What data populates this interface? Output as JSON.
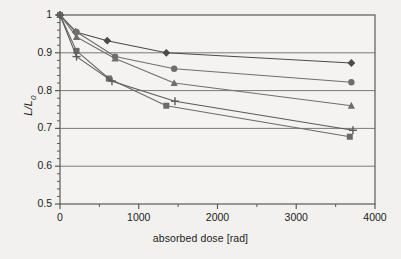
{
  "chart_data": {
    "type": "line",
    "title": "",
    "xlabel": "absorbed dose [rad]",
    "ylabel": "L/L0",
    "ylabel_main": "L/L",
    "ylabel_sub": "0",
    "xlim": [
      0,
      4000
    ],
    "ylim": [
      0.5,
      1.0
    ],
    "xticks": [
      0,
      1000,
      2000,
      3000,
      4000
    ],
    "xtick_labels": [
      "0",
      "1000",
      "2000",
      "3000",
      "4000"
    ],
    "xminor_interval": 500,
    "yticks": [
      0.5,
      0.6,
      0.7,
      0.8,
      0.9,
      1.0
    ],
    "ytick_labels": [
      "0.5",
      "0.6",
      "0.7",
      "0.8",
      "0.9",
      "1"
    ],
    "yminor_interval": 0.02,
    "grid": "horizontal-major",
    "legend": "none",
    "series": [
      {
        "name": "series-diamond",
        "marker": "diamond",
        "color": "#4a4a4a",
        "points": [
          {
            "x": 0,
            "y": 1.0
          },
          {
            "x": 200,
            "y": 0.955
          },
          {
            "x": 600,
            "y": 0.932
          },
          {
            "x": 1350,
            "y": 0.9
          },
          {
            "x": 3700,
            "y": 0.873
          }
        ]
      },
      {
        "name": "series-circle",
        "marker": "circle",
        "color": "#6e6e6e",
        "points": [
          {
            "x": 0,
            "y": 1.0
          },
          {
            "x": 210,
            "y": 0.955
          },
          {
            "x": 700,
            "y": 0.89
          },
          {
            "x": 1450,
            "y": 0.858
          },
          {
            "x": 3700,
            "y": 0.822
          }
        ]
      },
      {
        "name": "series-triangle",
        "marker": "triangle",
        "color": "#6e6e6e",
        "points": [
          {
            "x": 0,
            "y": 1.0
          },
          {
            "x": 210,
            "y": 0.942
          },
          {
            "x": 700,
            "y": 0.885
          },
          {
            "x": 1450,
            "y": 0.82
          },
          {
            "x": 3700,
            "y": 0.76
          }
        ]
      },
      {
        "name": "series-square",
        "marker": "square",
        "color": "#6a6a6a",
        "points": [
          {
            "x": 0,
            "y": 1.0
          },
          {
            "x": 210,
            "y": 0.905
          },
          {
            "x": 620,
            "y": 0.832
          },
          {
            "x": 1350,
            "y": 0.76
          },
          {
            "x": 3680,
            "y": 0.678
          }
        ]
      },
      {
        "name": "series-plus",
        "marker": "plus",
        "color": "#5a5a5a",
        "points": [
          {
            "x": 0,
            "y": 1.0
          },
          {
            "x": 210,
            "y": 0.89
          },
          {
            "x": 660,
            "y": 0.825
          },
          {
            "x": 1460,
            "y": 0.772
          },
          {
            "x": 3720,
            "y": 0.695
          }
        ]
      }
    ]
  },
  "colors": {
    "background": "#f2f1ef",
    "axis": "#5a5a5a",
    "grid": "#7a7a7a",
    "text": "#1c1c1c"
  }
}
